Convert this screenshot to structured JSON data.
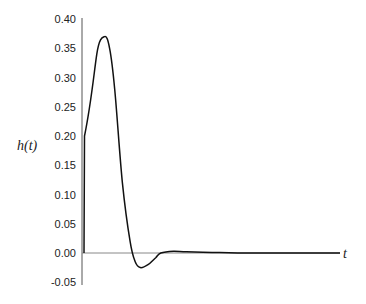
{
  "chart_data": {
    "type": "line",
    "title": "",
    "xlabel": "t",
    "ylabel": "h(t)",
    "ylim": [
      -0.05,
      0.4
    ],
    "yticks": [
      "0.40",
      "0.35",
      "0.30",
      "0.25",
      "0.20",
      "0.15",
      "0.10",
      "0.05",
      "0.00",
      "-0.05"
    ],
    "grid": false,
    "legend": null,
    "series": [
      {
        "name": "h(t)",
        "x": [
          0,
          0.02,
          0.05,
          0.08,
          0.1,
          0.12,
          0.15,
          0.18,
          0.2,
          0.22,
          0.25,
          0.28,
          0.3,
          0.35,
          0.4,
          0.5,
          0.6,
          0.8,
          1.0
        ],
        "y": [
          0,
          0.2,
          0.34,
          0.37,
          0.35,
          0.28,
          0.12,
          0.02,
          -0.015,
          -0.025,
          -0.02,
          -0.008,
          0.0,
          0.003,
          0.002,
          0.001,
          0.0,
          0.0,
          0.0
        ]
      }
    ]
  }
}
